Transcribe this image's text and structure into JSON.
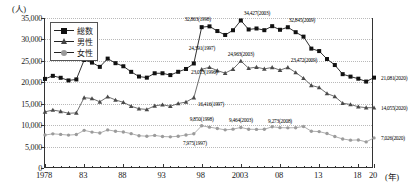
{
  "axis": {
    "unit_label": "(人)",
    "x_unit_label": "(年)",
    "y_ticks": [
      "0",
      "5,000",
      "10,000",
      "15,000",
      "20,000",
      "25,000",
      "30,000",
      "35,000"
    ],
    "x_ticks": [
      "1978",
      "83",
      "88",
      "93",
      "98",
      "2003",
      "08",
      "13",
      "18",
      "20"
    ]
  },
  "legend": {
    "items": [
      {
        "label": "総数",
        "marker": "sq"
      },
      {
        "label": "男性",
        "marker": "tri"
      },
      {
        "label": "女性",
        "marker": "cir"
      }
    ]
  },
  "annotations": [
    {
      "text": "24,391(1997)",
      "x": 1997,
      "y": 24391,
      "dx": -4,
      "dy": -15,
      "anchor": "right"
    },
    {
      "text": "23,013(1996)",
      "x": 1996,
      "y": 23013,
      "dx": 6,
      "dy": 3,
      "anchor": "right"
    },
    {
      "text": "32,863(1998)",
      "x": 1998,
      "y": 32863,
      "dx": -3,
      "dy": -8,
      "anchor": "end"
    },
    {
      "text": "34,427(2003)",
      "x": 2003,
      "y": 34427,
      "dx": 4,
      "dy": -7,
      "anchor": "right"
    },
    {
      "text": "32,845(2009)",
      "x": 2009,
      "y": 32845,
      "dx": 2,
      "dy": -7,
      "anchor": "right"
    },
    {
      "text": "21,081(2020)",
      "x": 2020,
      "y": 21081,
      "dx": 8,
      "dy": 0,
      "anchor": "right"
    },
    {
      "text": "16,416(1997)",
      "x": 1997,
      "y": 16416,
      "dx": 5,
      "dy": 6,
      "anchor": "right"
    },
    {
      "text": "24,963(2003)",
      "x": 2003,
      "y": 24963,
      "dx": 1,
      "dy": -7,
      "anchor": "end"
    },
    {
      "text": "23,472(2009)",
      "x": 2009,
      "y": 23472,
      "dx": 4,
      "dy": -7,
      "anchor": "right"
    },
    {
      "text": "14,055(2020)",
      "x": 2020,
      "y": 14055,
      "dx": 8,
      "dy": 0,
      "anchor": "right"
    },
    {
      "text": "7,975(1997)",
      "x": 1997,
      "y": 7975,
      "dx": 2,
      "dy": 9,
      "anchor": "end"
    },
    {
      "text": "9,850(1998)",
      "x": 1998,
      "y": 9850,
      "dx": 1,
      "dy": -7,
      "anchor": "end"
    },
    {
      "text": "9,464(2003)",
      "x": 2003,
      "y": 9464,
      "dx": 1,
      "dy": -7,
      "anchor": "end"
    },
    {
      "text": "9,273(2008)",
      "x": 2008,
      "y": 9273,
      "dx": 1,
      "dy": -7,
      "anchor": "end"
    },
    {
      "text": "7,026(2020)",
      "x": 2020,
      "y": 7026,
      "dx": 8,
      "dy": 0,
      "anchor": "right"
    }
  ],
  "chart_data": {
    "type": "line",
    "title": "",
    "xlabel": "(年)",
    "ylabel": "(人)",
    "ylim": [
      0,
      35000
    ],
    "xlim": [
      1978,
      2020
    ],
    "grid": true,
    "legend_position": "top-left",
    "x": [
      1978,
      1979,
      1980,
      1981,
      1982,
      1983,
      1984,
      1985,
      1986,
      1987,
      1988,
      1989,
      1990,
      1991,
      1992,
      1993,
      1994,
      1995,
      1996,
      1997,
      1998,
      1999,
      2000,
      2001,
      2002,
      2003,
      2004,
      2005,
      2006,
      2007,
      2008,
      2009,
      2010,
      2011,
      2012,
      2013,
      2014,
      2015,
      2016,
      2017,
      2018,
      2019,
      2020
    ],
    "series": [
      {
        "name": "総数",
        "marker": "square",
        "values": [
          20788,
          21503,
          21048,
          20434,
          20668,
          25202,
          24596,
          23599,
          25524,
          24460,
          23742,
          22436,
          21346,
          21084,
          22104,
          22104,
          21679,
          22445,
          23104,
          24391,
          32863,
          33048,
          31957,
          31042,
          32143,
          34427,
          32325,
          32552,
          32155,
          33093,
          32249,
          32845,
          31690,
          30651,
          27858,
          27283,
          25427,
          24025,
          21897,
          21321,
          20840,
          20169,
          21081
        ]
      },
      {
        "name": "男性",
        "marker": "triangle",
        "values": [
          13102,
          13532,
          13209,
          12761,
          12865,
          16416,
          16223,
          15435,
          16630,
          15880,
          15331,
          14417,
          13824,
          13667,
          14500,
          14755,
          14407,
          15039,
          15393,
          16416,
          23013,
          23512,
          22727,
          22144,
          23080,
          24963,
          23272,
          23540,
          23119,
          23478,
          22831,
          23472,
          22283,
          20955,
          19273,
          18787,
          17386,
          16681,
          15121,
          14826,
          14290,
          14078,
          14055
        ]
      },
      {
        "name": "女性",
        "marker": "circle",
        "values": [
          7686,
          7971,
          7839,
          7673,
          7803,
          8786,
          8373,
          8164,
          8894,
          8580,
          8411,
          8019,
          7522,
          7417,
          7604,
          7349,
          7272,
          7406,
          7711,
          7975,
          9850,
          9536,
          9230,
          8898,
          9063,
          9464,
          9053,
          9012,
          9036,
          9615,
          9418,
          9373,
          9407,
          9696,
          8585,
          8496,
          8041,
          7344,
          6776,
          6495,
          6550,
          6091,
          7026
        ]
      }
    ]
  }
}
